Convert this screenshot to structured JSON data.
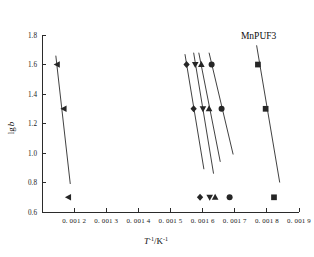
{
  "chart_data": {
    "type": "line",
    "title": "",
    "annotation": "MnPUF3",
    "xlabel_parts": {
      "base": "T",
      "exp1": "-1",
      "mid": "/K",
      "exp2": "-1"
    },
    "xlabel": "T-1/K-1",
    "ylabel_parts": {
      "prefix": "lg",
      "italic": "b"
    },
    "ylabel": "lg b",
    "xlim": [
      0.0011,
      0.0019
    ],
    "ylim": [
      0.6,
      1.8
    ],
    "grid": false,
    "legend_position": "in-plot-bottom-row",
    "x_ticks": [
      "0. 001 2",
      "0. 001 3",
      "0. 001 4",
      "0. 001 5",
      "0. 001 6",
      "0. 001 7",
      "0. 001 8",
      "0. 001 9"
    ],
    "x_tick_values": [
      0.0012,
      0.0013,
      0.0014,
      0.0015,
      0.0016,
      0.0017,
      0.0018,
      0.0019
    ],
    "y_ticks": [
      "0.6",
      "0.8",
      "1.0",
      "1.2",
      "1.4",
      "1.6",
      "1.8"
    ],
    "y_tick_values": [
      0.6,
      0.8,
      1.0,
      1.2,
      1.4,
      1.6,
      1.8
    ],
    "series": [
      {
        "name": "series-left-triangle",
        "marker": "left-triangle",
        "line": {
          "x": [
            0.001143,
            0.001188
          ],
          "y": [
            1.66,
            0.79
          ]
        },
        "points": [
          {
            "x": 0.001147,
            "y": 1.6
          },
          {
            "x": 0.001168,
            "y": 1.3
          }
        ],
        "legend_marker": {
          "x": 0.001182,
          "y": 0.7
        }
      },
      {
        "name": "series-diamond",
        "marker": "diamond",
        "line": {
          "x": [
            0.001545,
            0.001604
          ],
          "y": [
            1.67,
            0.89
          ]
        },
        "points": [
          {
            "x": 0.00155,
            "y": 1.6
          },
          {
            "x": 0.001572,
            "y": 1.3
          }
        ],
        "legend_marker": {
          "x": 0.001592,
          "y": 0.7
        }
      },
      {
        "name": "series-down-triangle",
        "marker": "down-triangle",
        "line": {
          "x": [
            0.001572,
            0.001634
          ],
          "y": [
            1.68,
            0.86
          ]
        },
        "points": [
          {
            "x": 0.001577,
            "y": 1.6
          },
          {
            "x": 0.001601,
            "y": 1.3
          }
        ],
        "legend_marker": {
          "x": 0.001622,
          "y": 0.7
        }
      },
      {
        "name": "series-up-triangle",
        "marker": "up-triangle",
        "line": {
          "x": [
            0.001588,
            0.001655
          ],
          "y": [
            1.68,
            0.94
          ]
        },
        "points": [
          {
            "x": 0.001596,
            "y": 1.6
          },
          {
            "x": 0.00162,
            "y": 1.3
          }
        ],
        "legend_marker": {
          "x": 0.001639,
          "y": 0.7
        }
      },
      {
        "name": "series-circle",
        "marker": "circle",
        "line": {
          "x": [
            0.00162,
            0.001695
          ],
          "y": [
            1.68,
            0.99
          ]
        },
        "points": [
          {
            "x": 0.001628,
            "y": 1.6
          },
          {
            "x": 0.001659,
            "y": 1.3
          }
        ],
        "legend_marker": {
          "x": 0.001684,
          "y": 0.7
        }
      },
      {
        "name": "series-square",
        "marker": "square",
        "line": {
          "x": [
            0.001768,
            0.00184
          ],
          "y": [
            1.73,
            0.8
          ]
        },
        "points": [
          {
            "x": 0.001772,
            "y": 1.6
          },
          {
            "x": 0.001796,
            "y": 1.3
          }
        ],
        "legend_marker": {
          "x": 0.001822,
          "y": 0.7
        }
      }
    ]
  },
  "colors": {
    "axis": "#2b2b2b",
    "line": "#2b2b2b",
    "marker": "#262626",
    "text": "#1a1a1a",
    "background": "#ffffff"
  }
}
